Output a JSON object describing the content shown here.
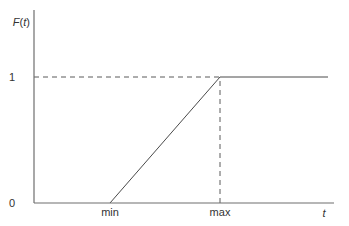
{
  "chart_data": {
    "type": "line",
    "title": "",
    "xlabel": "t",
    "ylabel": "F(t)",
    "ylabel_parts": {
      "func": "F",
      "arg": "t"
    },
    "x_ticks": [
      {
        "label": "min",
        "value": 1
      },
      {
        "label": "max",
        "value": 2
      }
    ],
    "y_ticks": [
      {
        "label": "0",
        "value": 0
      },
      {
        "label": "1",
        "value": 1
      }
    ],
    "xlim": [
      0,
      3
    ],
    "ylim": [
      0,
      1.5
    ],
    "series": [
      {
        "name": "F(t)",
        "description": "Uniform distribution CDF",
        "points": [
          [
            1,
            0
          ],
          [
            2,
            1
          ],
          [
            3,
            1
          ]
        ]
      }
    ],
    "guides": [
      {
        "type": "horizontal-dashed",
        "y": 1,
        "from_x": 0,
        "to_x": 2
      },
      {
        "type": "vertical-dashed",
        "x": 2,
        "from_y": 0,
        "to_y": 1
      }
    ],
    "grid": false,
    "legend": "none"
  }
}
